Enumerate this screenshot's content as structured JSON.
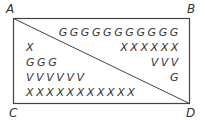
{
  "corners": {
    "A": "A",
    "B": "B",
    "C": "C",
    "D": "D"
  },
  "upper_triangle": {
    "rows": [
      "GGGGGGGGGGG",
      "XXXXXX",
      "VVV",
      "G"
    ]
  },
  "lower_triangle": {
    "rows": [
      "X",
      "GGG",
      "VVVVVV",
      "XXXXXXXXXXX"
    ]
  },
  "colors": {
    "line": "#444444",
    "text": "#333333"
  }
}
